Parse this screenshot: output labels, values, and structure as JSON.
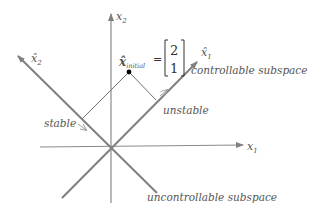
{
  "axes": {
    "x1_label": "x",
    "x1_sub": "1",
    "x2_label": "x",
    "x2_sub": "2",
    "x1hat_label": "x̂",
    "x1hat_sub": "1",
    "x2hat_label": "x̂",
    "x2hat_sub": "2"
  },
  "initial_state": {
    "label": "x̂",
    "sub": "initial",
    "equals": "=",
    "vector": [
      "2",
      "1"
    ]
  },
  "annotations": {
    "controllable": "controllable subspace",
    "uncontrollable": "uncontrollable subspace",
    "stable": "stable",
    "unstable": "unstable"
  },
  "colors": {
    "axis": "#8a8a8a",
    "text": "#555555",
    "point": "#000000"
  }
}
